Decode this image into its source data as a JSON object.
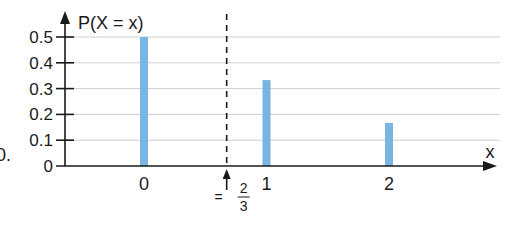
{
  "chart_data": {
    "type": "bar",
    "title": "",
    "ylabel": "P(X = x)",
    "xlabel": "x",
    "categories": [
      "0",
      "1",
      "2"
    ],
    "x": [
      0,
      1,
      2
    ],
    "values": [
      0.5,
      0.333,
      0.167
    ],
    "ylim": [
      0,
      0.5
    ],
    "yticks": [
      0,
      0.1,
      0.2,
      0.3,
      0.4,
      0.5
    ],
    "ytick_labels": [
      "0",
      "0.1",
      "0.2",
      "0.3",
      "0.4",
      "0.5"
    ],
    "grid": true,
    "bar_color": "#7ab4e0",
    "annotations": [
      {
        "type": "dashed-vertical-line",
        "x": 0.6667,
        "label": "= 2/3",
        "label_numerator": "2",
        "label_denominator": "3",
        "label_prefix": "="
      }
    ],
    "legend": null
  },
  "fragment_text": "0."
}
